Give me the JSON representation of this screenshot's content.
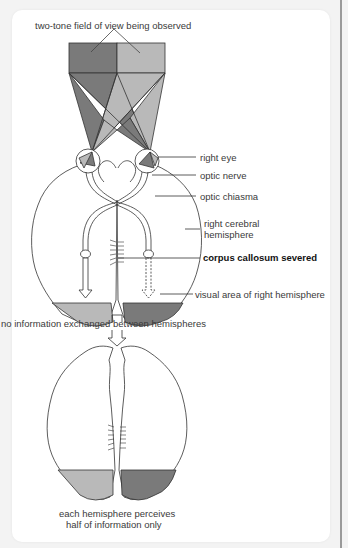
{
  "diagram": {
    "labels": {
      "field_of_view": "two-tone field of view being observed",
      "right_eye": "right eye",
      "optic_nerve": "optic nerve",
      "optic_chiasma": "optic chiasma",
      "right_cerebral_hemisphere_line1": "right cerebral",
      "right_cerebral_hemisphere_line2": "hemisphere",
      "corpus_callosum": "corpus callosum severed",
      "visual_area": "visual area of right hemisphere",
      "no_exchange": "no information exchanged between hemispheres",
      "each_hemisphere_line1": "each hemisphere perceives",
      "each_hemisphere_line2": "half of information only"
    },
    "colors": {
      "dark_field": "#7a7a7a",
      "light_field": "#b9b9b9",
      "outline": "#333333"
    }
  }
}
